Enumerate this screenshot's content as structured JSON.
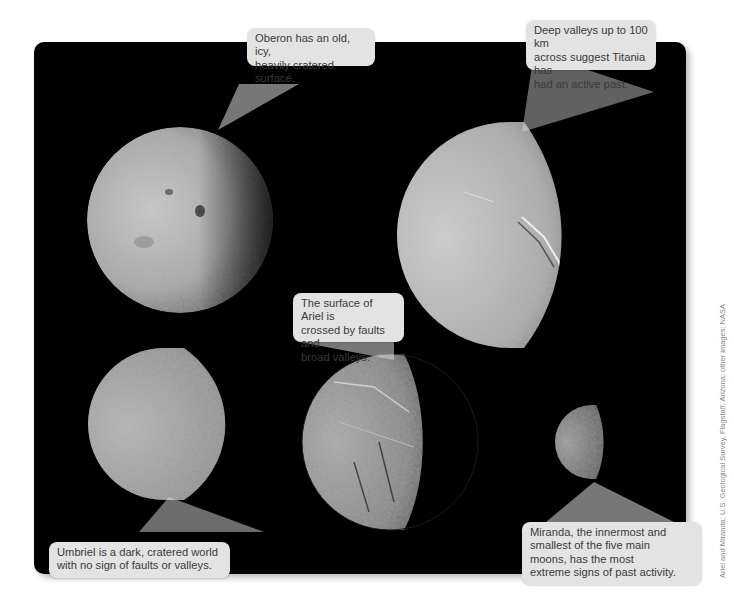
{
  "figure": {
    "panel_background": "#000000",
    "callout_background": "#e3e3e3",
    "callout_text_color": "#3a3a3a"
  },
  "moons": [
    {
      "name": "Oberon",
      "caption": "Oberon has an old, icy, heavily cratered surface."
    },
    {
      "name": "Titania",
      "caption": "Deep valleys up to 100 km across suggest Titania has had an active past."
    },
    {
      "name": "Ariel",
      "caption": "The surface of Ariel is crossed by faults and broad valleys."
    },
    {
      "name": "Umbriel",
      "caption": "Umbriel is a dark, cratered world with no sign of faults or valleys."
    },
    {
      "name": "Miranda",
      "caption": "Miranda, the innermost and smallest of the five main moons, has the most extreme signs of past activity."
    }
  ],
  "callouts": {
    "oberon_line1": "Oberon has an old, icy,",
    "oberon_line2": "heavily cratered surface.",
    "titania_line1": "Deep valleys up to 100 km",
    "titania_line2": "across suggest Titania has",
    "titania_line3": "had an active past.",
    "ariel_line1": "The surface of Ariel is",
    "ariel_line2": "crossed by faults and",
    "ariel_line3": "broad valleys.",
    "umbriel_line1": "Umbriel is a dark, cratered world",
    "umbriel_line2": "with no sign of faults or valleys.",
    "miranda_line1": "Miranda, the innermost and",
    "miranda_line2": "smallest of the five main",
    "miranda_line3": "moons, has the most",
    "miranda_line4": "extreme signs of past activity."
  },
  "credit": "Ariel and Miranda: U.S. Geological Survey, Flagstaff, Arizona; other images: NASA"
}
